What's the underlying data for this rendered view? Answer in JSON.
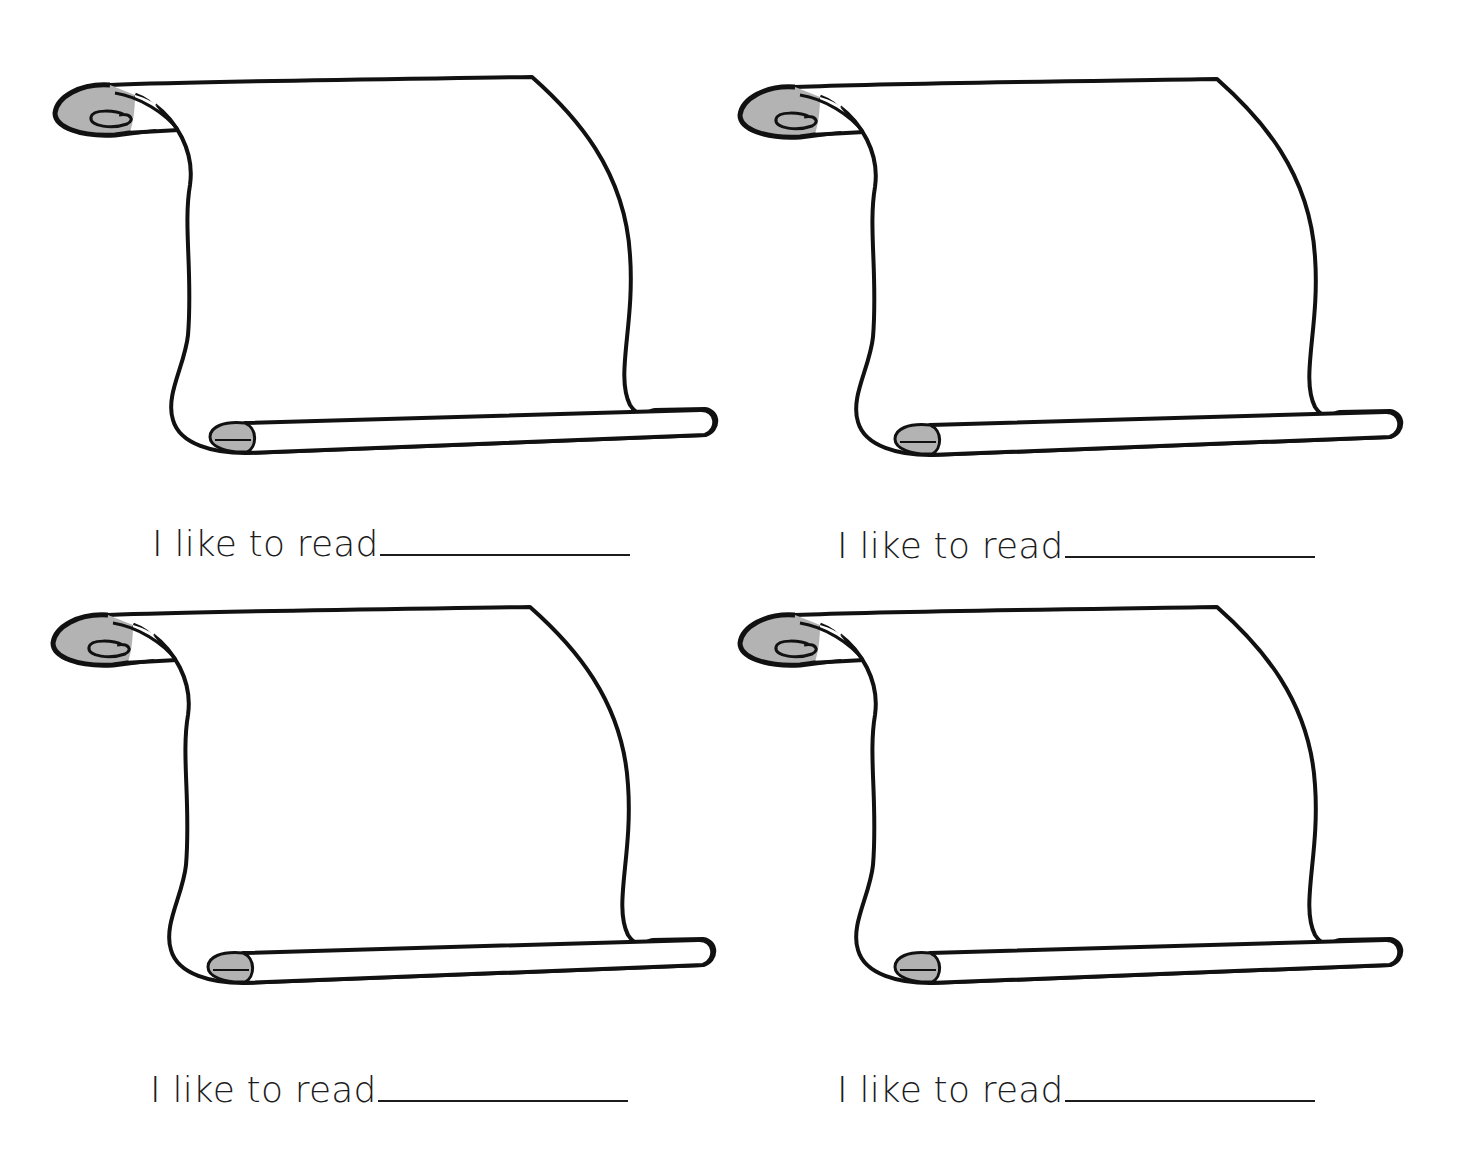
{
  "worksheet": {
    "cards": [
      {
        "prompt": "I like to read",
        "answer_blank": ""
      },
      {
        "prompt": "I like to read",
        "answer_blank": ""
      },
      {
        "prompt": "I like to read",
        "answer_blank": ""
      },
      {
        "prompt": "I like to read",
        "answer_blank": ""
      }
    ],
    "illustration": "scroll-icon",
    "colors": {
      "ink": "#111111",
      "scroll_shade": "#b3b3b3",
      "paper": "#ffffff"
    }
  }
}
